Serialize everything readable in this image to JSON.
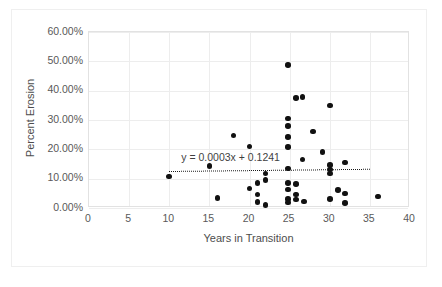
{
  "chart_data": {
    "type": "scatter",
    "title": "",
    "xlabel": "Years in Transition",
    "ylabel": "Percent Erosion",
    "xlim": [
      0,
      40
    ],
    "ylim": [
      0,
      0.6
    ],
    "xticks": [
      0,
      5,
      10,
      15,
      20,
      25,
      30,
      35,
      40
    ],
    "xtick_labels": [
      "0",
      "5",
      "10",
      "15",
      "20",
      "25",
      "30",
      "35",
      "40"
    ],
    "yticks": [
      0,
      0.1,
      0.2,
      0.3,
      0.4,
      0.5,
      0.6
    ],
    "ytick_labels": [
      "0.00%",
      "10.00%",
      "20.00%",
      "30.00%",
      "40.00%",
      "50.00%",
      "60.00%"
    ],
    "grid": true,
    "legend": false,
    "marker": "filled-circle",
    "marker_color": "#111111",
    "points": [
      {
        "x": 10.0,
        "y": 0.108
      },
      {
        "x": 15.0,
        "y": 0.143
      },
      {
        "x": 16.0,
        "y": 0.034
      },
      {
        "x": 18.0,
        "y": 0.247
      },
      {
        "x": 20.0,
        "y": 0.209
      },
      {
        "x": 20.0,
        "y": 0.066
      },
      {
        "x": 21.0,
        "y": 0.086
      },
      {
        "x": 21.0,
        "y": 0.046
      },
      {
        "x": 21.0,
        "y": 0.021
      },
      {
        "x": 22.0,
        "y": 0.117
      },
      {
        "x": 22.0,
        "y": 0.096
      },
      {
        "x": 22.0,
        "y": 0.011
      },
      {
        "x": 24.8,
        "y": 0.487
      },
      {
        "x": 24.8,
        "y": 0.305
      },
      {
        "x": 24.8,
        "y": 0.279
      },
      {
        "x": 24.8,
        "y": 0.243
      },
      {
        "x": 24.8,
        "y": 0.208
      },
      {
        "x": 24.8,
        "y": 0.135
      },
      {
        "x": 24.8,
        "y": 0.086
      },
      {
        "x": 24.8,
        "y": 0.063
      },
      {
        "x": 24.8,
        "y": 0.03
      },
      {
        "x": 24.8,
        "y": 0.019
      },
      {
        "x": 25.8,
        "y": 0.376
      },
      {
        "x": 25.8,
        "y": 0.082
      },
      {
        "x": 25.8,
        "y": 0.046
      },
      {
        "x": 25.8,
        "y": 0.029
      },
      {
        "x": 26.6,
        "y": 0.378
      },
      {
        "x": 26.6,
        "y": 0.166
      },
      {
        "x": 26.8,
        "y": 0.022
      },
      {
        "x": 27.9,
        "y": 0.261
      },
      {
        "x": 29.1,
        "y": 0.191
      },
      {
        "x": 30.0,
        "y": 0.35
      },
      {
        "x": 30.0,
        "y": 0.147
      },
      {
        "x": 30.0,
        "y": 0.131
      },
      {
        "x": 30.0,
        "y": 0.117
      },
      {
        "x": 30.0,
        "y": 0.03
      },
      {
        "x": 31.0,
        "y": 0.061
      },
      {
        "x": 31.9,
        "y": 0.155
      },
      {
        "x": 31.9,
        "y": 0.05
      },
      {
        "x": 31.9,
        "y": 0.017
      },
      {
        "x": 36.0,
        "y": 0.039
      }
    ],
    "trendline": {
      "equation": "y = 0.0003x + 0.1241",
      "slope": 0.0003,
      "intercept": 0.1241,
      "style": "dotted",
      "color": "#1a1a1a",
      "x_start": 10.0,
      "x_end": 35.0,
      "label_x": 11.5,
      "label_y": 0.175
    }
  }
}
